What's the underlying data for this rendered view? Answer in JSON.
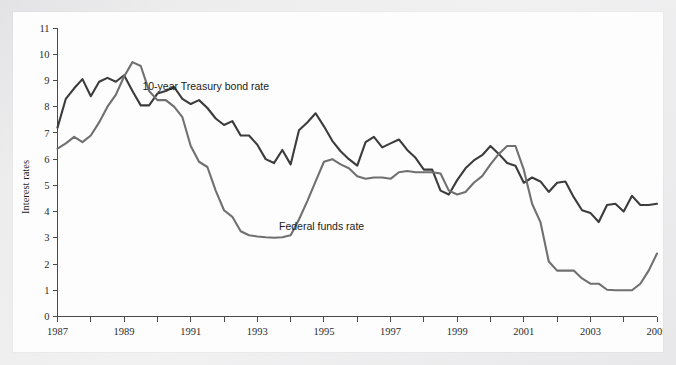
{
  "figure": {
    "background_color": "#fdfdfd",
    "page_color": "#e9e9ea"
  },
  "chart_data": {
    "type": "line",
    "title": "",
    "subtitle": "",
    "xlabel": "",
    "ylabel": "Interest rates",
    "xlim": [
      1987,
      2005
    ],
    "ylim": [
      0,
      11
    ],
    "grid": false,
    "legend_position": "inline-annotations",
    "y_ticks": [
      0,
      1,
      2,
      3,
      4,
      5,
      6,
      7,
      8,
      9,
      10,
      11
    ],
    "y_tick_labels": [
      "0",
      "1",
      "2",
      "3",
      "4",
      "5",
      "6",
      "7",
      "8",
      "9",
      "10",
      "11"
    ],
    "x_ticks": [
      1987,
      1988,
      1989,
      1990,
      1991,
      1992,
      1993,
      1994,
      1995,
      1996,
      1997,
      1998,
      1999,
      2000,
      2001,
      2002,
      2003,
      2004,
      2005
    ],
    "x_tick_labels": [
      "1987",
      "",
      "1989",
      "",
      "1991",
      "",
      "1993",
      "",
      "1995",
      "",
      "1997",
      "",
      "1999",
      "",
      "2001",
      "",
      "2003",
      "",
      "2005"
    ],
    "x_tick_labels_shown": [
      "1987",
      "1989",
      "1991",
      "1993",
      "1995",
      "1997",
      "1999",
      "2001",
      "2003",
      "2005"
    ],
    "annotations": [
      {
        "text": "10-year Treasury bond rate",
        "x": 1989.55,
        "y": 8.62,
        "series": "10-year Treasury bond rate"
      },
      {
        "text": "Federal funds rate",
        "x": 1993.65,
        "y": 3.28,
        "series": "Federal funds rate"
      }
    ],
    "series": [
      {
        "name": "10-year Treasury bond rate",
        "color": "#3c3c3c",
        "width": 2.1,
        "x": [
          1987.0,
          1987.25,
          1987.5,
          1987.75,
          1988.0,
          1988.25,
          1988.5,
          1988.75,
          1989.0,
          1989.25,
          1989.5,
          1989.75,
          1990.0,
          1990.25,
          1990.5,
          1990.75,
          1991.0,
          1991.25,
          1991.5,
          1991.75,
          1992.0,
          1992.25,
          1992.5,
          1992.75,
          1993.0,
          1993.25,
          1993.5,
          1993.75,
          1994.0,
          1994.25,
          1994.5,
          1994.75,
          1995.0,
          1995.25,
          1995.5,
          1995.75,
          1996.0,
          1996.25,
          1996.5,
          1996.75,
          1997.0,
          1997.25,
          1997.5,
          1997.75,
          1998.0,
          1998.25,
          1998.5,
          1998.75,
          1999.0,
          1999.25,
          1999.5,
          1999.75,
          2000.0,
          2000.25,
          2000.5,
          2000.75,
          2001.0,
          2001.25,
          2001.5,
          2001.75,
          2002.0,
          2002.25,
          2002.5,
          2002.75,
          2003.0,
          2003.25,
          2003.5,
          2003.75,
          2004.0,
          2004.25,
          2004.5,
          2004.75,
          2005.0
        ],
        "y": [
          7.2,
          8.3,
          8.7,
          9.05,
          8.4,
          8.95,
          9.1,
          8.95,
          9.2,
          8.6,
          8.05,
          8.05,
          8.5,
          8.6,
          8.75,
          8.3,
          8.1,
          8.25,
          7.95,
          7.55,
          7.3,
          7.45,
          6.9,
          6.9,
          6.55,
          6.0,
          5.85,
          6.35,
          5.8,
          7.1,
          7.4,
          7.75,
          7.25,
          6.7,
          6.3,
          6.0,
          5.75,
          6.65,
          6.85,
          6.45,
          6.6,
          6.75,
          6.35,
          6.05,
          5.6,
          5.6,
          4.8,
          4.65,
          5.2,
          5.65,
          5.95,
          6.15,
          6.5,
          6.2,
          5.85,
          5.75,
          5.1,
          5.3,
          5.15,
          4.75,
          5.1,
          5.15,
          4.55,
          4.05,
          3.95,
          3.6,
          4.25,
          4.3,
          4.0,
          4.6,
          4.25,
          4.25,
          4.3
        ]
      },
      {
        "name": "Federal funds rate",
        "color": "#707070",
        "width": 2.1,
        "x": [
          1987.0,
          1987.25,
          1987.5,
          1987.75,
          1988.0,
          1988.25,
          1988.5,
          1988.75,
          1989.0,
          1989.25,
          1989.5,
          1989.75,
          1990.0,
          1990.25,
          1990.5,
          1990.75,
          1991.0,
          1991.25,
          1991.5,
          1991.75,
          1992.0,
          1992.25,
          1992.5,
          1992.75,
          1993.0,
          1993.25,
          1993.5,
          1993.75,
          1994.0,
          1994.25,
          1994.5,
          1994.75,
          1995.0,
          1995.25,
          1995.5,
          1995.75,
          1996.0,
          1996.25,
          1996.5,
          1996.75,
          1997.0,
          1997.25,
          1997.5,
          1997.75,
          1998.0,
          1998.25,
          1998.5,
          1998.75,
          1999.0,
          1999.25,
          1999.5,
          1999.75,
          2000.0,
          2000.25,
          2000.5,
          2000.75,
          2001.0,
          2001.25,
          2001.5,
          2001.75,
          2002.0,
          2002.25,
          2002.5,
          2002.75,
          2003.0,
          2003.25,
          2003.5,
          2003.75,
          2004.0,
          2004.25,
          2004.5,
          2004.75,
          2005.0
        ],
        "y": [
          6.4,
          6.6,
          6.85,
          6.65,
          6.9,
          7.4,
          8.0,
          8.45,
          9.15,
          9.7,
          9.55,
          8.6,
          8.25,
          8.25,
          8.0,
          7.6,
          6.5,
          5.9,
          5.7,
          4.8,
          4.05,
          3.8,
          3.25,
          3.1,
          3.05,
          3.02,
          3.0,
          3.02,
          3.1,
          3.7,
          4.4,
          5.15,
          5.9,
          6.0,
          5.8,
          5.65,
          5.35,
          5.25,
          5.3,
          5.3,
          5.25,
          5.5,
          5.55,
          5.5,
          5.5,
          5.5,
          5.45,
          4.8,
          4.65,
          4.75,
          5.1,
          5.35,
          5.8,
          6.2,
          6.5,
          6.5,
          5.6,
          4.3,
          3.6,
          2.1,
          1.75,
          1.75,
          1.75,
          1.45,
          1.25,
          1.25,
          1.02,
          1.0,
          1.0,
          1.0,
          1.25,
          1.75,
          2.4
        ]
      }
    ]
  }
}
